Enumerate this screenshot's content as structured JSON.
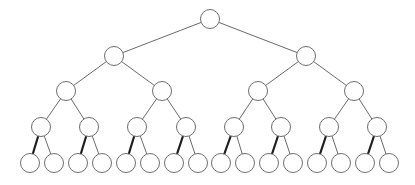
{
  "diagram": {
    "type": "complete-binary-tree",
    "depth_levels": 5,
    "node_count": 31,
    "node_radius": 9.5,
    "colors": {
      "background": "#ffffff",
      "node_fill": "#ffffff",
      "node_stroke": "#6e6e6e",
      "edge": "#6a6a6a",
      "bold_edge": "#1e1e1e"
    },
    "levels": [
      {
        "level": 0,
        "y": 19,
        "x": [
          210
        ]
      },
      {
        "level": 1,
        "y": 56,
        "x": [
          114,
          306
        ]
      },
      {
        "level": 2,
        "y": 91,
        "x": [
          66,
          162,
          258,
          354
        ]
      },
      {
        "level": 3,
        "y": 127,
        "x": [
          41,
          89,
          137,
          186,
          234,
          281,
          329,
          377
        ]
      },
      {
        "level": 4,
        "y": 163,
        "x": [
          30,
          54,
          78,
          102,
          126,
          150,
          174,
          198,
          221,
          245,
          269,
          293,
          317,
          341,
          365,
          389
        ]
      }
    ],
    "bold_edges_note": "Edges from each level-3 node to its left child are drawn thicker/darker",
    "bold_edge_levels": [
      3
    ]
  }
}
